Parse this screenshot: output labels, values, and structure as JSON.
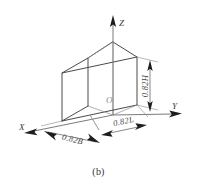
{
  "figure": {
    "caption": "(b)",
    "type": "axonometric-wireframe-box",
    "origin_label": "O",
    "axes": [
      {
        "id": "x",
        "label": "X",
        "direction": "lower-left"
      },
      {
        "id": "y",
        "label": "Y",
        "direction": "right"
      },
      {
        "id": "z",
        "label": "Z",
        "direction": "up"
      }
    ],
    "dimensions": [
      {
        "id": "width",
        "label": "0.82B",
        "axis": "X",
        "placement": "bottom-front-left"
      },
      {
        "id": "length",
        "label": "0.82L",
        "axis": "Y",
        "placement": "bottom-front-right"
      },
      {
        "id": "height",
        "label": "0.82H",
        "axis": "Z",
        "placement": "right-vertical"
      }
    ],
    "colors": {
      "background": "#ffffff",
      "visible_edge": "#4a4a4a",
      "hidden_edge": "#8f8f8f",
      "axis": "#6b6b6b",
      "extension_line": "#9a9a9a",
      "arrow": "#1d1d1d",
      "text": "#3b3b3b",
      "origin_text": "#8a8a8a"
    }
  }
}
